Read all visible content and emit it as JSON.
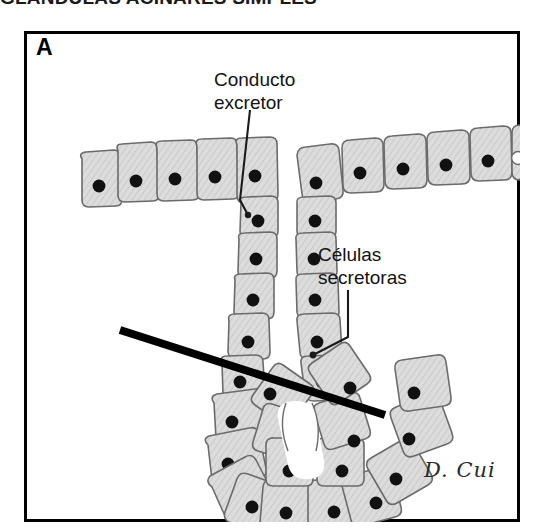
{
  "figure": {
    "title": "GLÁNDULAS ACINARES SIMPLES",
    "panel_letter": "A",
    "signature": "D. Cui"
  },
  "labels": {
    "duct": "Conducto\nexcretor",
    "secretory_cells": "Células\nsecretoras"
  },
  "colors": {
    "cell_fill": "#d9d9d9",
    "cell_stroke": "#6b6b6b",
    "nucleus": "#111111",
    "frame": "#000000",
    "section_line": "#000000",
    "leader_line": "#1a1a1a",
    "background": "#ffffff"
  },
  "diagram": {
    "type": "histology-illustration",
    "parts": [
      {
        "name": "surface-epithelium-left",
        "cell_count": 5,
        "nuclei": "solid",
        "description": "row of cuboidal/columnar surface epithelial cells left of the duct opening"
      },
      {
        "name": "surface-epithelium-right",
        "cell_count": 6,
        "nuclei": "solid except rightmost cell which is hollow",
        "description": "row of surface epithelial cells right of the duct opening, sloping upward"
      },
      {
        "name": "excretory-duct",
        "cell_columns": 2,
        "cells_per_column": 5,
        "description": "vertical tubular duct with narrow central lumen leading down to the acinus"
      },
      {
        "name": "acinus",
        "cell_count": 16,
        "description": "U-shaped cluster of wedge-shaped secretory cells radiating around a central lumen"
      },
      {
        "name": "section-plane-line",
        "description": "thick black diagonal line indicating the plane of section across the acinus",
        "from": [
          120,
          330
        ],
        "to": [
          385,
          415
        ]
      }
    ],
    "leaders": [
      {
        "name": "duct-leader",
        "style": "straight",
        "from_label": "duct",
        "points": [
          [
            250,
            110
          ],
          [
            240,
            200
          ],
          [
            248,
            215
          ]
        ]
      },
      {
        "name": "secretory-cells-leader",
        "style": "elbow",
        "from_label": "secretory_cells",
        "points": [
          [
            348,
            290
          ],
          [
            348,
            337
          ],
          [
            313,
            355
          ]
        ]
      }
    ]
  }
}
